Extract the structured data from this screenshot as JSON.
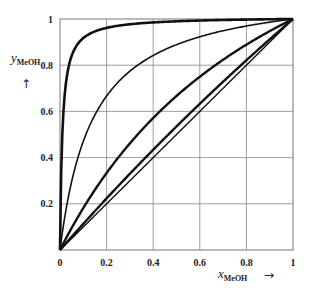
{
  "chart_data": {
    "type": "line",
    "title": "",
    "xlabel": "x_MeOH",
    "xlabel_main": "x",
    "xlabel_sub": "MeOH",
    "ylabel": "y_MeOH",
    "ylabel_main": "y",
    "ylabel_sub": "MeOH",
    "x_arrow": "→",
    "y_arrow": "↑",
    "xlim": [
      0,
      1
    ],
    "ylim": [
      0,
      1
    ],
    "grid": true,
    "legend": "none",
    "x_ticks": [
      "0",
      "0.2",
      "0.4",
      "0.6",
      "0.8",
      "1"
    ],
    "y_ticks": [
      "0.2",
      "0.4",
      "0.6",
      "0.8",
      "1"
    ],
    "x": [
      0,
      0.02,
      0.05,
      0.1,
      0.2,
      0.3,
      0.4,
      0.5,
      0.6,
      0.7,
      0.8,
      0.9,
      1.0
    ],
    "series": [
      {
        "name": "curve-1 (thick, alpha~100)",
        "alpha": 100,
        "width": 2.6,
        "values": [
          0,
          0.67,
          0.84,
          0.92,
          0.96,
          0.98,
          0.99,
          0.99,
          0.99,
          1.0,
          1.0,
          1.0,
          1.0
        ]
      },
      {
        "name": "curve-2 (thin, alpha~8)",
        "alpha": 8,
        "width": 1.6,
        "values": [
          0,
          0.14,
          0.3,
          0.47,
          0.67,
          0.77,
          0.84,
          0.89,
          0.92,
          0.95,
          0.97,
          0.99,
          1.0
        ]
      },
      {
        "name": "curve-3 (thick, alpha~2)",
        "alpha": 2,
        "width": 2.4,
        "values": [
          0,
          0.04,
          0.1,
          0.18,
          0.33,
          0.46,
          0.57,
          0.67,
          0.75,
          0.82,
          0.89,
          0.95,
          1.0
        ]
      },
      {
        "name": "curve-4 (thick, alpha~1.15)",
        "alpha": 1.15,
        "width": 2.4,
        "values": [
          0,
          0.023,
          0.057,
          0.113,
          0.223,
          0.33,
          0.434,
          0.535,
          0.633,
          0.728,
          0.821,
          0.912,
          1.0
        ]
      },
      {
        "name": "diagonal y=x",
        "alpha": 1,
        "width": 1.4,
        "values": [
          0,
          0.02,
          0.05,
          0.1,
          0.2,
          0.3,
          0.4,
          0.5,
          0.6,
          0.7,
          0.8,
          0.9,
          1.0
        ]
      }
    ]
  }
}
